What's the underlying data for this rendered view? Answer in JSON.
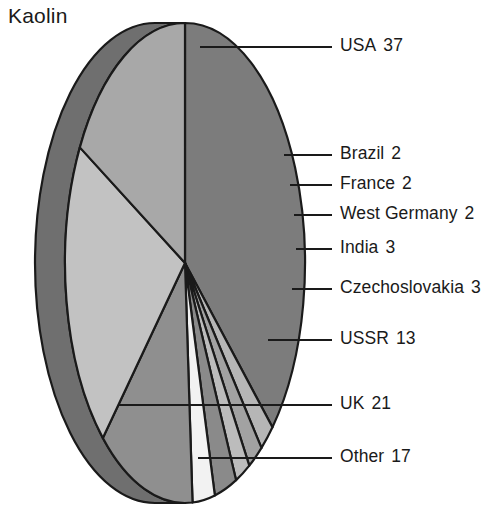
{
  "title": "Kaolin",
  "clipped_top_text": "",
  "chart_data": {
    "type": "pie",
    "title": "Kaolin",
    "xlabel": "",
    "ylabel": "",
    "unit": "percent",
    "total": 100,
    "style": "3d-elliptical-pie",
    "legend_position": "right-callouts",
    "grid": false,
    "categories": [
      "USA",
      "Brazil",
      "France",
      "West Germany",
      "India",
      "Czechoslovakia",
      "USSR",
      "UK",
      "Other"
    ],
    "values": [
      37,
      2,
      2,
      2,
      3,
      3,
      13,
      21,
      17
    ],
    "slices": [
      {
        "label": "USA",
        "value": 37,
        "color": "#7c7c7c",
        "label_x": 340,
        "label_y": 37,
        "leader_x1": 200,
        "leader_y1": 47,
        "leader_x2": 332,
        "leader_y2": 47
      },
      {
        "label": "Brazil",
        "value": 2,
        "color": "#b6b6b6",
        "label_x": 340,
        "label_y": 145,
        "leader_x1": 284,
        "leader_y1": 155,
        "leader_x2": 332,
        "leader_y2": 155
      },
      {
        "label": "France",
        "value": 2,
        "color": "#a2a2a2",
        "label_x": 340,
        "label_y": 175,
        "leader_x1": 290,
        "leader_y1": 185,
        "leader_x2": 332,
        "leader_y2": 185
      },
      {
        "label": "West Germany",
        "value": 2,
        "color": "#bcbcbc",
        "label_x": 340,
        "label_y": 205,
        "leader_x1": 294,
        "leader_y1": 215,
        "leader_x2": 332,
        "leader_y2": 215
      },
      {
        "label": "India",
        "value": 3,
        "color": "#8a8a8a",
        "label_x": 340,
        "label_y": 239,
        "leader_x1": 296,
        "leader_y1": 249,
        "leader_x2": 332,
        "leader_y2": 249
      },
      {
        "label": "Czechoslovakia",
        "value": 3,
        "color": "#f2f2f2",
        "label_x": 340,
        "label_y": 279,
        "leader_x1": 292,
        "leader_y1": 289,
        "leader_x2": 332,
        "leader_y2": 289
      },
      {
        "label": "USSR",
        "value": 13,
        "color": "#8f8f8f",
        "label_x": 340,
        "label_y": 330,
        "leader_x1": 268,
        "leader_y1": 340,
        "leader_x2": 332,
        "leader_y2": 340
      },
      {
        "label": "UK",
        "value": 21,
        "color": "#c2c2c2",
        "label_x": 340,
        "label_y": 395,
        "leader_x1": 118,
        "leader_y1": 405,
        "leader_x2": 332,
        "leader_y2": 405
      },
      {
        "label": "Other",
        "value": 17,
        "color": "#a8a8a8",
        "label_x": 340,
        "label_y": 448,
        "leader_x1": 198,
        "leader_y1": 458,
        "leader_x2": 332,
        "leader_y2": 458
      }
    ],
    "colors": {
      "stroke": "#1a1a1a",
      "side_wall": "#6f6f6f",
      "rim_outer": "#8a8a8a",
      "background": "#ffffff",
      "text": "#1a1a1a"
    },
    "geometry": {
      "center_x": 185,
      "center_y": 263,
      "radius_x": 120,
      "radius_y": 240,
      "depth_x": 30,
      "start_angle_deg": -90
    }
  }
}
